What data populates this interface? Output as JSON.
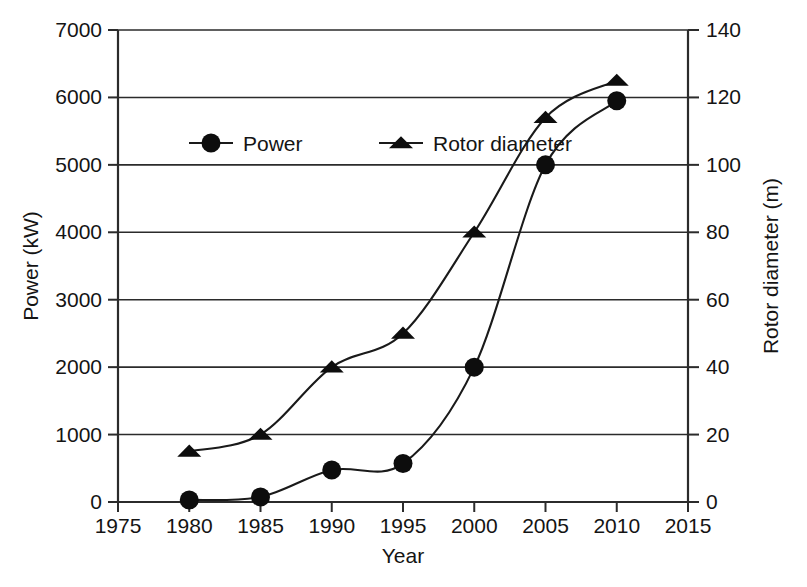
{
  "chart_data": {
    "type": "line",
    "title": "",
    "subtitle": "",
    "xlabel": "Year",
    "ylabel": "Power (kW)",
    "y2label": "Rotor diameter (m)",
    "x": [
      1980,
      1985,
      1990,
      1995,
      2000,
      2005,
      2010
    ],
    "xlim": [
      1975,
      2015
    ],
    "xticks": [
      "1975",
      "1980",
      "1985",
      "1990",
      "1995",
      "2000",
      "2005",
      "2010",
      "2015"
    ],
    "xtick_values": [
      1975,
      1980,
      1985,
      1990,
      1995,
      2000,
      2005,
      2010,
      2015
    ],
    "ylim": [
      0,
      7000
    ],
    "yticks": [
      "0",
      "1000",
      "2000",
      "3000",
      "4000",
      "5000",
      "6000",
      "7000"
    ],
    "ytick_values": [
      0,
      1000,
      2000,
      3000,
      4000,
      5000,
      6000,
      7000
    ],
    "y2lim": [
      0,
      140
    ],
    "y2ticks": [
      "0",
      "20",
      "40",
      "60",
      "80",
      "100",
      "120",
      "140"
    ],
    "y2tick_values": [
      0,
      20,
      40,
      60,
      80,
      100,
      120,
      140
    ],
    "grid": "horizontal",
    "legend_position": "upper-left-inside",
    "series": [
      {
        "name": "Power",
        "axis": "left",
        "marker": "circle",
        "units": "kW",
        "values": [
          30,
          75,
          475,
          570,
          2000,
          5000,
          5950
        ]
      },
      {
        "name": "Rotor diameter",
        "axis": "right",
        "marker": "triangle",
        "units": "m",
        "values": [
          15,
          20,
          40,
          50,
          80,
          114,
          125
        ]
      }
    ],
    "colors": {
      "line": "#1a1a1a",
      "marker": "#0d0d0d",
      "grid": "#2b2b2b",
      "axis": "#2b2b2b",
      "background": "#ffffff"
    }
  },
  "legend": {
    "items": [
      {
        "label": "Power",
        "marker": "circle"
      },
      {
        "label": "Rotor diameter",
        "marker": "triangle"
      }
    ]
  }
}
